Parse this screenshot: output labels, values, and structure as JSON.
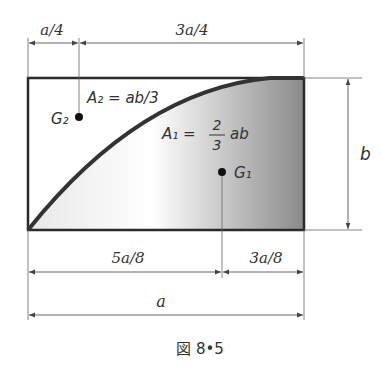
{
  "figure": {
    "caption": "図 8•5",
    "dimensions": {
      "top_left": "a/4",
      "top_right": "3a/4",
      "right": "b",
      "bottom_left": "5a/8",
      "bottom_right": "3a/8",
      "bottom_total": "a"
    },
    "regions": {
      "upper": {
        "area_label": "A₂ = ab/3",
        "centroid_label": "G₂"
      },
      "lower": {
        "area_prefix": "A₁ =",
        "frac_num": "2",
        "frac_den": "3",
        "area_suffix": "ab",
        "centroid_label": "G₁"
      }
    },
    "colors": {
      "outline": "#2a2a2a",
      "curve": "#3a3a3a",
      "fill_light": "#ffffff",
      "fill_dark": "#8c8c8c",
      "dimension": "#555555"
    }
  }
}
